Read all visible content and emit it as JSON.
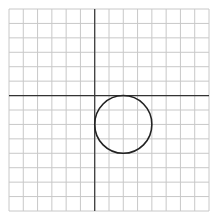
{
  "chart_data": {
    "type": "scatter",
    "title": "",
    "xlabel": "",
    "ylabel": "",
    "grid": true,
    "grid_spacing": 1,
    "xlim": [
      -6,
      8
    ],
    "ylim": [
      -8,
      6
    ],
    "axes": {
      "x_axis_y": 0,
      "y_axis_x": 0
    },
    "shapes": [
      {
        "kind": "circle",
        "center": [
          2,
          -2
        ],
        "radius": 2,
        "equation": "(x-2)^2 + (y+2)^2 = 4"
      }
    ],
    "colors": {
      "grid": "#c8c8c8",
      "axis": "#333333",
      "curve": "#222222",
      "background": "#ffffff"
    }
  }
}
